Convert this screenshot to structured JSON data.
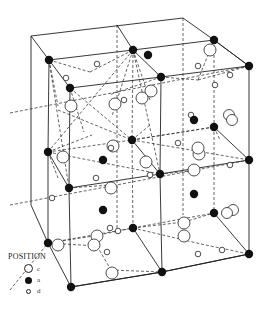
{
  "diagram": {
    "title": ""
  },
  "legend": {
    "title": "POSITION",
    "items": [
      {
        "symbol": "large-open-circle",
        "label": "c"
      },
      {
        "symbol": "filled-circle",
        "label": "a"
      },
      {
        "symbol": "small-open-circle",
        "label": "d"
      }
    ]
  },
  "colors": {
    "line": "#222222",
    "filled_site": "#111111",
    "open_site_fill": "#ffffff"
  }
}
